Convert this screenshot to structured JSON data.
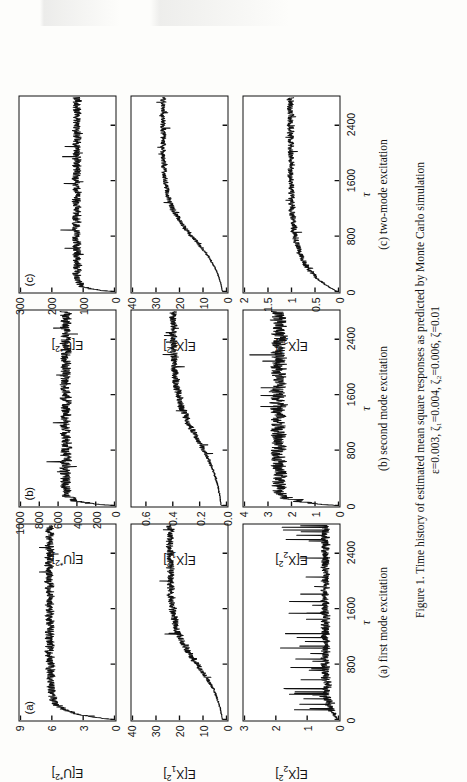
{
  "figure": {
    "caption_line1": "Figure 1.  Time history of estimated mean square responses as predicted by Monte Carlo simulation",
    "caption_line2": "ε=0.003,  ζ₁=0.004,  ζ₂=0.006,  ζ=0.01",
    "xlabel": "τ",
    "subcaptions": [
      "(a) first mode excitation",
      "(b) second mode excitation",
      "(c) two-mode excitation"
    ],
    "panel_tags": [
      "(a)",
      "(b)",
      "(c)"
    ],
    "ink_color": "#111111",
    "paper_color": "#fdfdfb"
  },
  "chart_data": [
    {
      "id": "a-top",
      "type": "line",
      "column": "(a) first mode excitation",
      "panel_tag": "(a)",
      "title": "",
      "xlabel": "τ",
      "ylabel": "E[U*2]",
      "ylabel_html": "E[U<sup>*2</sup>]",
      "xlim": [
        0,
        2800
      ],
      "ylim": [
        0,
        9
      ],
      "xticks": [
        0,
        800,
        1600,
        2400
      ],
      "yticks": [
        0,
        3,
        6,
        9
      ],
      "grid": false,
      "legend": "none",
      "noise_amp": 0.55,
      "ramp": {
        "start": 0,
        "rise_end": 260,
        "plateau": 6.2,
        "initial": 0.15
      },
      "description": "rapid rise to plateau near 6.2 with strong noise"
    },
    {
      "id": "a-mid",
      "type": "line",
      "column": "(a) first mode excitation",
      "panel_tag": "",
      "xlabel": "τ",
      "ylabel": "E[X1^2]",
      "ylabel_html": "E[X<sub>1</sub><sup>2</sup>]",
      "xlim": [
        0,
        2800
      ],
      "ylim": [
        0,
        40
      ],
      "xticks": [
        0,
        800,
        1600,
        2400
      ],
      "yticks": [
        0,
        10,
        20,
        30,
        40
      ],
      "grid": false,
      "legend": "none",
      "noise_amp": 2.0,
      "ramp": {
        "start": 0,
        "rise_end": 1500,
        "plateau": 24.0,
        "initial": 0.5
      },
      "description": "gradual rise from 0 toward ~24 with heavy noise band"
    },
    {
      "id": "a-bot",
      "type": "line",
      "column": "(a) first mode excitation",
      "panel_tag": "",
      "xlabel": "τ",
      "ylabel": "E[X2^2]",
      "ylabel_html": "E[X<sub>2</sub><sup>2</sup>]",
      "xlim": [
        0,
        2800
      ],
      "ylim": [
        0,
        3.0
      ],
      "xticks": [
        0,
        800,
        1600,
        2400
      ],
      "yticks": [
        0.0,
        1.0,
        2.0,
        3.0
      ],
      "grid": false,
      "legend": "none",
      "noise_amp": 0.18,
      "ramp": {
        "start": 0,
        "rise_end": 520,
        "plateau": 0.42,
        "initial": 0.02
      },
      "spikes": true,
      "description": "flat low level near 0.4 with frequent upward spikes to ~1.5"
    },
    {
      "id": "b-top",
      "type": "line",
      "column": "(b) second mode excitation",
      "panel_tag": "(b)",
      "xlabel": "τ",
      "ylabel": "E[U*2]",
      "ylabel_html": "E[U<sup>*2</sup>]",
      "xlim": [
        0,
        2800
      ],
      "ylim": [
        0,
        1000
      ],
      "xticks": [
        0,
        800,
        1600,
        2400
      ],
      "yticks": [
        0,
        200,
        400,
        600,
        800,
        1000
      ],
      "grid": false,
      "legend": "none",
      "noise_amp": 75,
      "ramp": {
        "start": 0,
        "rise_end": 120,
        "plateau": 520,
        "initial": 10
      },
      "description": "jumps quickly to ~520 and fluctuates strongly"
    },
    {
      "id": "b-mid",
      "type": "line",
      "column": "(b) second mode excitation",
      "panel_tag": "",
      "xlabel": "τ",
      "ylabel": "E[X1^2]",
      "ylabel_html": "E[X<sub>1</sub><sup>2</sup>]",
      "xlim": [
        0,
        2800
      ],
      "ylim": [
        0.0,
        0.7
      ],
      "xticks": [
        0,
        800,
        1600,
        2400
      ],
      "yticks": [
        0.0,
        0.2,
        0.4,
        0.6
      ],
      "grid": false,
      "legend": "none",
      "noise_amp": 0.035,
      "ramp": {
        "start": 0,
        "rise_end": 1800,
        "plateau": 0.4,
        "initial": 0.02
      },
      "description": "slow climb from ~0.18 to ~0.40 with noise"
    },
    {
      "id": "b-bot",
      "type": "line",
      "column": "(b) second mode excitation",
      "panel_tag": "",
      "xlabel": "τ",
      "ylabel": "E[X2^2]",
      "ylabel_html": "E[X<sub>2</sub><sup>2</sup>]",
      "xlim": [
        0,
        2800
      ],
      "ylim": [
        0,
        4
      ],
      "xticks": [
        0,
        800,
        1600,
        2400
      ],
      "yticks": [
        0,
        1,
        2,
        3,
        4
      ],
      "grid": false,
      "legend": "none",
      "noise_amp": 0.42,
      "ramp": {
        "start": 0,
        "rise_end": 150,
        "plateau": 2.55,
        "initial": 0.05
      },
      "description": "rises to ~2.5 quickly then oscillates between 2 and 3"
    },
    {
      "id": "c-top",
      "type": "line",
      "column": "(c) two-mode excitation",
      "panel_tag": "(c)",
      "xlabel": "τ",
      "ylabel": "E[U*2]",
      "ylabel_html": "E[U<sup>*2</sup>]",
      "xlim": [
        0,
        2800
      ],
      "ylim": [
        0,
        300
      ],
      "xticks": [
        0,
        100,
        200,
        300
      ],
      "yticks": [
        0,
        100,
        200,
        300
      ],
      "grid": false,
      "legend": "none",
      "noise_amp": 18,
      "ramp": {
        "start": 0,
        "rise_end": 110,
        "plateau": 120,
        "initial": 5
      },
      "description": "jumps to ~120 and fluctuates"
    },
    {
      "id": "c-mid",
      "type": "line",
      "column": "(c) two-mode excitation",
      "panel_tag": "",
      "xlabel": "τ",
      "ylabel": "E[X1^2]",
      "ylabel_html": "E[X<sub>1</sub><sup>2</sup>]",
      "xlim": [
        0,
        2800
      ],
      "ylim": [
        0,
        40
      ],
      "xticks": [
        0,
        800,
        1600,
        2400
      ],
      "yticks": [
        0,
        10,
        20,
        30,
        40
      ],
      "grid": false,
      "legend": "none",
      "noise_amp": 1.4,
      "ramp": {
        "start": 0,
        "rise_end": 1450,
        "plateau": 27.0,
        "initial": 0.3
      },
      "description": "smooth S-shaped rise to ~27 then noisy plateau"
    },
    {
      "id": "c-bot",
      "type": "line",
      "column": "(c) two-mode excitation",
      "panel_tag": "",
      "xlabel": "τ",
      "ylabel": "E[X2^2]",
      "ylabel_html": "E[X<sub>2</sub><sup>2</sup>]",
      "xlim": [
        0,
        2800
      ],
      "ylim": [
        0,
        2
      ],
      "xticks": [
        0,
        800,
        1600,
        2400
      ],
      "yticks": [
        0,
        0.5,
        1,
        1.5,
        2
      ],
      "grid": false,
      "legend": "none",
      "noise_amp": 0.085,
      "ramp": {
        "start": 0,
        "rise_end": 900,
        "plateau": 1.02,
        "initial": 0.03
      },
      "description": "rises to ~1.0 and fluctuates"
    }
  ]
}
